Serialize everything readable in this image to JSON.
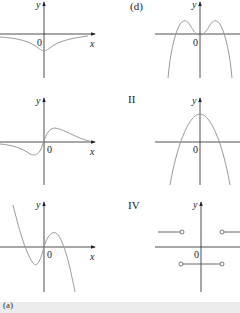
{
  "figure": {
    "panels": [
      {
        "id": "panel-1",
        "label": "",
        "axis_x_label": "x",
        "axis_y_label": "y",
        "origin_label": "0",
        "description": "negative bell-shaped dip below x-axis, minimum at origin"
      },
      {
        "id": "panel-2",
        "label": "(d)",
        "axis_x_label": "",
        "axis_y_label": "y",
        "origin_label": "0",
        "description": "quartic W-inverted curve with two peaks and local min at origin"
      },
      {
        "id": "panel-3",
        "label": "",
        "axis_x_label": "x",
        "axis_y_label": "y",
        "origin_label": "0",
        "description": "odd function: trough left of origin, peak right, decaying to 0"
      },
      {
        "id": "panel-4",
        "label": "II",
        "axis_x_label": "",
        "axis_y_label": "y",
        "origin_label": "0",
        "description": "downward parabola with vertex above origin"
      },
      {
        "id": "panel-5",
        "label": "",
        "axis_x_label": "x",
        "axis_y_label": "y",
        "origin_label": "0",
        "description": "cubic with local min left of origin and local max right"
      },
      {
        "id": "panel-6",
        "label": "IV",
        "axis_x_label": "",
        "axis_y_label": "y",
        "origin_label": "0",
        "description": "step function: horizontal segments with open circles"
      }
    ],
    "colors": {
      "axis": "#222222",
      "curve": "#9a9a9a",
      "strip": "#ececec"
    }
  },
  "footer": {
    "label": "(a)"
  }
}
